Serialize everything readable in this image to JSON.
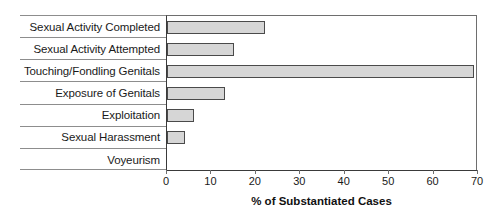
{
  "chart_data": {
    "type": "bar",
    "orientation": "horizontal",
    "title": "",
    "xlabel": "% of Substantiated Cases",
    "ylabel": "",
    "categories": [
      "Sexual Activity Completed",
      "Sexual Activity Attempted",
      "Touching/Fondling Genitals",
      "Exposure of Genitals",
      "Exploitation",
      "Sexual Harassment",
      "Voyeurism"
    ],
    "values": [
      22,
      15,
      69,
      13,
      6,
      4,
      0
    ],
    "xlim": [
      0,
      70
    ],
    "xticks": [
      0,
      10,
      20,
      30,
      40,
      50,
      60,
      70
    ],
    "xtick_labels": [
      "0",
      "10",
      "20",
      "30",
      "40",
      "50",
      "60",
      "70"
    ],
    "grid": false,
    "legend": "none",
    "bar_fill": "#d6d6d6",
    "bar_border": "#4a4a4a"
  }
}
